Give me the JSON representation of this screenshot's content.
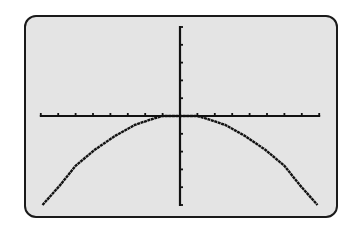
{
  "calculator_screen": {
    "description": "Graphing calculator display",
    "background_color": "#e4e4e4",
    "plot_color": "#111111"
  },
  "chart_data": {
    "type": "line",
    "title": "",
    "xlabel": "",
    "ylabel": "",
    "grid": false,
    "axis_ticks": {
      "x_ticks_each_side": 8,
      "y_ticks_above": 5,
      "y_ticks_below": 5
    },
    "xlim": [
      -8,
      8
    ],
    "ylim": [
      -5,
      5
    ],
    "series": [
      {
        "name": "f(x)",
        "x": [
          -7.9,
          -6.9,
          -6.0,
          -4.9,
          -3.7,
          -2.6,
          -1.7,
          -1.0,
          0,
          1.0,
          1.7,
          2.6,
          3.7,
          4.9,
          6.0,
          6.9,
          7.9
        ],
        "y": [
          -5.0,
          -3.9,
          -2.8,
          -1.9,
          -1.1,
          -0.5,
          -0.2,
          0,
          0,
          0,
          -0.2,
          -0.5,
          -1.1,
          -1.9,
          -2.8,
          -3.9,
          -5.0
        ]
      }
    ]
  }
}
